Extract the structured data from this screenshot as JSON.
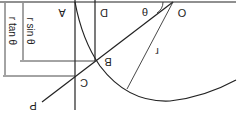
{
  "diagram": {
    "orientation": "rotated-180",
    "points": {
      "O": "O",
      "A": "A",
      "B": "B",
      "C": "C",
      "D": "D",
      "P": "P"
    },
    "angle_label": "θ",
    "radius_label": "r",
    "dimensions": {
      "sin": "r sin θ",
      "tan": "r tan θ"
    },
    "colors": {
      "stroke": "#222222",
      "background": "#ffffff"
    }
  }
}
